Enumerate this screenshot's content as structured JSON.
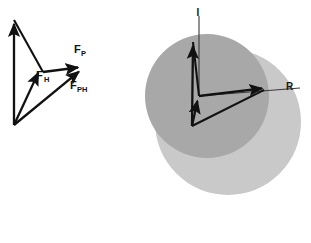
{
  "figure": {
    "background_color": "#ffffff",
    "width": 311,
    "height": 243
  },
  "palette": {
    "vector_stroke": "#111111",
    "thin_line_stroke": "#3a3a3a",
    "sphere_back": "#c9c9c9",
    "sphere_front": "#a8a8a8",
    "label_color": "#111111"
  },
  "left_diagram": {
    "name": "force-vector-triangle",
    "origin": {
      "x": 14,
      "y": 125
    },
    "vectors": [
      {
        "id": "vertical-force",
        "label": "",
        "sub": "",
        "from": {
          "x": 14,
          "y": 125
        },
        "to": {
          "x": 14,
          "y": 20
        },
        "arrowhead": true
      },
      {
        "id": "f-h",
        "label": "F",
        "sub": "H",
        "label_x": 36,
        "label_y": 79,
        "sub_x": 44,
        "sub_y": 82,
        "from": {
          "x": 14,
          "y": 125
        },
        "to": {
          "x": 40,
          "y": 69
        },
        "arrowhead": true
      },
      {
        "id": "f-p",
        "label": "F",
        "sub": "P",
        "label_x": 74,
        "label_y": 53,
        "sub_x": 81,
        "sub_y": 56,
        "from": {
          "x": 43,
          "y": 72
        },
        "to": {
          "x": 82,
          "y": 67
        },
        "arrowhead": true
      },
      {
        "id": "f-ph",
        "label": "F",
        "sub": "PH",
        "label_x": 70,
        "label_y": 89,
        "sub_x": 77,
        "sub_y": 92,
        "from": {
          "x": 14,
          "y": 125
        },
        "to": {
          "x": 82,
          "y": 69
        },
        "arrowhead": true
      }
    ],
    "connector_lines": [
      {
        "id": "apex-to-mid",
        "from": {
          "x": 14,
          "y": 20
        },
        "to": {
          "x": 43,
          "y": 72
        }
      }
    ]
  },
  "right_diagram": {
    "name": "sphere-reflection-diagram",
    "spheres": [
      {
        "id": "back-sphere",
        "cx": 228,
        "cy": 122,
        "r": 73,
        "fill": "#c9c9c9"
      },
      {
        "id": "front-sphere",
        "cx": 207,
        "cy": 96,
        "r": 62,
        "fill": "#a8a8a8"
      }
    ],
    "vertex": {
      "x": 199,
      "y": 96
    },
    "lower_vertex": {
      "x": 192,
      "y": 126
    },
    "axes": [
      {
        "id": "incident-axis",
        "label": "I",
        "label_x": 200,
        "label_y": 12,
        "from": {
          "x": 199,
          "y": 96
        },
        "to": {
          "x": 199,
          "y": 16
        }
      },
      {
        "id": "reflection-axis",
        "label": "R",
        "label_x": 288,
        "label_y": 90,
        "from": {
          "x": 199,
          "y": 96
        },
        "to": {
          "x": 300,
          "y": 88
        }
      }
    ],
    "vectors": [
      {
        "id": "up-left-vector",
        "from": {
          "x": 192,
          "y": 126
        },
        "to": {
          "x": 193,
          "y": 42
        },
        "arrowhead": true
      },
      {
        "id": "inner-short-vector",
        "from": {
          "x": 192,
          "y": 126
        },
        "to": {
          "x": 198,
          "y": 98
        },
        "arrowhead": true
      },
      {
        "id": "right-vector",
        "from": {
          "x": 199,
          "y": 96
        },
        "to": {
          "x": 266,
          "y": 88
        },
        "arrowhead": true
      }
    ],
    "connector_lines": [
      {
        "id": "apex-to-base",
        "from": {
          "x": 193,
          "y": 42
        },
        "to": {
          "x": 199,
          "y": 96
        }
      },
      {
        "id": "base-to-right",
        "from": {
          "x": 192,
          "y": 126
        },
        "to": {
          "x": 266,
          "y": 89
        }
      }
    ]
  }
}
